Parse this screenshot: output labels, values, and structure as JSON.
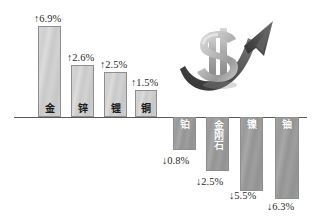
{
  "chart_data": {
    "type": "bar",
    "title": "",
    "subtitle": "",
    "xlabel": "",
    "ylabel": "",
    "grid": false,
    "legend": "none",
    "axis_baseline": 0,
    "unit": "%",
    "categories": [
      "金",
      "锌",
      "锂",
      "铜",
      "铂",
      "金刚石",
      "镍",
      "铀"
    ],
    "values": [
      6.9,
      2.6,
      2.5,
      1.5,
      -0.8,
      -2.5,
      -5.5,
      -6.3
    ],
    "data_labels": [
      "↑6.9%",
      "↑2.6%",
      "↑2.5%",
      "↑1.5%",
      "↓0.8%",
      "↓2.5%",
      "↓5.5%",
      "↓6.3%"
    ],
    "ylim": [
      -7.0,
      7.6
    ],
    "series": [
      {
        "name": "涨跌幅",
        "values": [
          6.9,
          2.6,
          2.5,
          1.5,
          -0.8,
          -2.5,
          -5.5,
          -6.3
        ]
      }
    ]
  },
  "bars": [
    {
      "name": "金",
      "value": 6.9,
      "label": "↑6.9%",
      "direction": "up",
      "stacked": false,
      "left": 38,
      "width": 23,
      "length": 91,
      "pct_left": 34,
      "pct_top": 13
    },
    {
      "name": "锌",
      "value": 2.6,
      "label": "↑2.6%",
      "direction": "up",
      "stacked": false,
      "left": 71,
      "width": 23,
      "length": 52,
      "pct_left": 67,
      "pct_top": 52
    },
    {
      "name": "锂",
      "value": 2.5,
      "label": "↑2.5%",
      "direction": "up",
      "stacked": false,
      "left": 104,
      "width": 23,
      "length": 45,
      "pct_left": 100,
      "pct_top": 59
    },
    {
      "name": "铜",
      "value": 1.5,
      "label": "↑1.5%",
      "direction": "up",
      "stacked": false,
      "left": 135,
      "width": 22,
      "length": 27,
      "pct_left": 131,
      "pct_top": 77
    },
    {
      "name": "铂",
      "value": -0.8,
      "label": "↓0.8%",
      "direction": "down",
      "stacked": false,
      "left": 173,
      "width": 23,
      "length": 33,
      "pct_left": 162,
      "pct_top": 155
    },
    {
      "name": "金刚石",
      "value": -2.5,
      "label": "↓2.5%",
      "direction": "down",
      "stacked": true,
      "left": 206,
      "width": 23,
      "length": 54,
      "pct_left": 196,
      "pct_top": 176
    },
    {
      "name": "镍",
      "value": -5.5,
      "label": "↓5.5%",
      "direction": "down",
      "stacked": false,
      "left": 240,
      "width": 23,
      "length": 74,
      "pct_left": 229,
      "pct_top": 190
    },
    {
      "name": "铀",
      "value": -6.3,
      "label": "↓6.3%",
      "direction": "down",
      "stacked": false,
      "left": 275,
      "width": 24,
      "length": 82,
      "pct_left": 267,
      "pct_top": 201
    }
  ],
  "decoration": {
    "name": "dollar-sign-rising-arrow",
    "description": "金色美元符号与上扬箭头",
    "colors": {
      "arrow_dark": "#3d3d3d",
      "arrow_mid": "#6e6e6e",
      "dollar_light": "#c4c4c4",
      "dollar_shadow": "#7d7d7d"
    }
  },
  "colors": {
    "bar_positive": "#cfcfcf",
    "bar_negative": "#9a9a9a",
    "bar_border": "#8e8e8e",
    "axis": "#5a5a5a",
    "label_text": "#2a2a2a",
    "background": "#ffffff"
  }
}
